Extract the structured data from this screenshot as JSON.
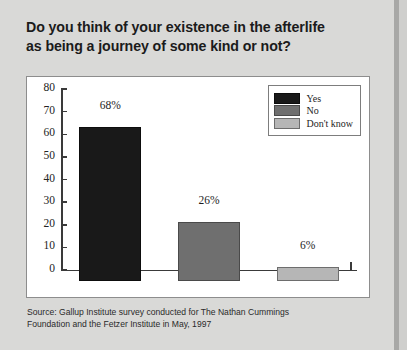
{
  "title": {
    "line1": "Do you think of your existence in the afterlife",
    "line2": "as being a journey of some kind or not?"
  },
  "source": {
    "line1": "Source: Gallup Institute survey conducted for The Nathan Cummings",
    "line2": "Foundation and the Fetzer Institute in May, 1997"
  },
  "chart_data": {
    "type": "bar",
    "title": "Do you think of your existence in the afterlife as being a journey of some kind or not?",
    "categories": [
      "Yes",
      "No",
      "Don't know"
    ],
    "values": [
      68,
      26,
      6
    ],
    "data_labels": [
      "68%",
      "26%",
      "6%"
    ],
    "colors": [
      "#191919",
      "#6f6f6f",
      "#b6b6b6"
    ],
    "xlabel": "",
    "ylabel": "",
    "ylim": [
      0,
      80
    ],
    "ytick_values": [
      80,
      70,
      60,
      50,
      40,
      30,
      20,
      10,
      0
    ],
    "ytick_labels": [
      "80",
      "70",
      "60",
      "50",
      "40",
      "30",
      "20",
      "10",
      "0"
    ],
    "grid": false,
    "legend_position": "top-right",
    "legend": [
      {
        "label": "Yes",
        "color": "#191919"
      },
      {
        "label": "No",
        "color": "#6f6f6f"
      },
      {
        "label": "Don't know",
        "color": "#b6b6b6"
      }
    ]
  },
  "style": {
    "background": "#d9d9d7",
    "panel_background": "#ffffff",
    "axis_color": "#3a3a3a"
  }
}
